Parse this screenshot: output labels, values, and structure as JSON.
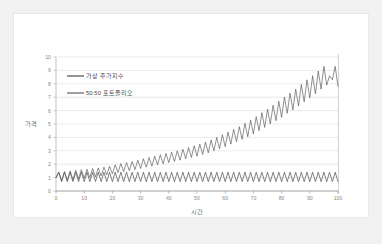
{
  "chart_data": {
    "type": "line",
    "title": "",
    "xlabel": "시간",
    "ylabel": "가격",
    "xlim": [
      0,
      100
    ],
    "ylim": [
      0,
      10
    ],
    "xticks": [
      0,
      10,
      20,
      30,
      40,
      50,
      60,
      70,
      80,
      90,
      100
    ],
    "xtick_labels": [
      "0",
      "10",
      "20",
      "30",
      "40",
      "50",
      "60",
      "70",
      "80",
      "90",
      "100"
    ],
    "yticks": [
      0,
      1,
      2,
      3,
      4,
      5,
      6,
      7,
      8,
      9,
      10
    ],
    "ytick_labels": [
      "0",
      "1",
      "2",
      "3",
      "4",
      "5",
      "6",
      "7",
      "8",
      "9",
      "10"
    ],
    "grid": true,
    "grid_axis": "y",
    "legend_position": "upper-left",
    "legend": [
      "가상 주가지수",
      "50:50 포트폴리오"
    ],
    "series": [
      {
        "name": "가상 주가지수",
        "color": "#3f3f3f",
        "x": [
          0,
          1,
          2,
          3,
          4,
          5,
          6,
          7,
          8,
          9,
          10,
          11,
          12,
          13,
          14,
          15,
          16,
          17,
          18,
          19,
          20,
          21,
          22,
          23,
          24,
          25,
          26,
          27,
          28,
          29,
          30,
          31,
          32,
          33,
          34,
          35,
          36,
          37,
          38,
          39,
          40,
          41,
          42,
          43,
          44,
          45,
          46,
          47,
          48,
          49,
          50,
          51,
          52,
          53,
          54,
          55,
          56,
          57,
          58,
          59,
          60,
          61,
          62,
          63,
          64,
          65,
          66,
          67,
          68,
          69,
          70,
          71,
          72,
          73,
          74,
          75,
          76,
          77,
          78,
          79,
          80,
          81,
          82,
          83,
          84,
          85,
          86,
          87,
          88,
          89,
          90,
          91,
          92,
          93,
          94,
          95,
          96,
          97,
          98,
          99,
          100
        ],
        "values": [
          1.0,
          1.4,
          0.7,
          1.4,
          0.7,
          1.4,
          0.7,
          1.4,
          0.7,
          1.4,
          0.7,
          1.4,
          0.7,
          1.4,
          0.7,
          1.4,
          0.7,
          1.4,
          0.7,
          1.4,
          0.7,
          1.4,
          0.7,
          1.4,
          0.7,
          1.4,
          0.7,
          1.4,
          0.7,
          1.4,
          0.7,
          1.4,
          0.7,
          1.4,
          0.7,
          1.4,
          0.7,
          1.4,
          0.7,
          1.4,
          0.7,
          1.4,
          0.7,
          1.4,
          0.7,
          1.4,
          0.7,
          1.4,
          0.7,
          1.4,
          0.7,
          1.4,
          0.7,
          1.4,
          0.7,
          1.4,
          0.7,
          1.4,
          0.7,
          1.4,
          0.7,
          1.4,
          0.7,
          1.4,
          0.7,
          1.4,
          0.7,
          1.4,
          0.7,
          1.4,
          0.7,
          1.4,
          0.7,
          1.4,
          0.7,
          1.4,
          0.7,
          1.4,
          0.7,
          1.4,
          0.7,
          1.4,
          0.7,
          1.4,
          0.7,
          1.4,
          0.7,
          1.4,
          0.7,
          1.4,
          0.7,
          1.4,
          0.7,
          1.4,
          0.7,
          1.4,
          0.7,
          1.4,
          0.7,
          1.4,
          0.7
        ]
      },
      {
        "name": "50:50 포트폴리오",
        "color": "#555555",
        "x": [
          0,
          1,
          2,
          3,
          4,
          5,
          6,
          7,
          8,
          9,
          10,
          11,
          12,
          13,
          14,
          15,
          16,
          17,
          18,
          19,
          20,
          21,
          22,
          23,
          24,
          25,
          26,
          27,
          28,
          29,
          30,
          31,
          32,
          33,
          34,
          35,
          36,
          37,
          38,
          39,
          40,
          41,
          42,
          43,
          44,
          45,
          46,
          47,
          48,
          49,
          50,
          51,
          52,
          53,
          54,
          55,
          56,
          57,
          58,
          59,
          60,
          61,
          62,
          63,
          64,
          65,
          66,
          67,
          68,
          69,
          70,
          71,
          72,
          73,
          74,
          75,
          76,
          77,
          78,
          79,
          80,
          81,
          82,
          83,
          84,
          85,
          86,
          87,
          88,
          89,
          90,
          91,
          92,
          93,
          94,
          95,
          96,
          97,
          98,
          99,
          100
        ],
        "values": [
          1.0,
          1.4,
          0.75,
          1.45,
          0.8,
          1.5,
          0.85,
          1.55,
          0.9,
          1.6,
          0.95,
          1.62,
          1.0,
          1.68,
          1.05,
          1.72,
          1.12,
          1.78,
          1.2,
          1.85,
          1.28,
          1.95,
          1.38,
          2.05,
          1.45,
          2.12,
          1.52,
          2.2,
          1.6,
          2.3,
          1.68,
          2.4,
          1.78,
          2.5,
          1.85,
          2.6,
          1.95,
          2.7,
          2.02,
          2.8,
          2.12,
          2.9,
          2.2,
          3.0,
          2.3,
          3.12,
          2.4,
          3.25,
          2.5,
          3.38,
          2.6,
          3.5,
          2.72,
          3.65,
          2.85,
          3.8,
          3.0,
          4.0,
          3.15,
          4.2,
          3.3,
          4.4,
          3.5,
          4.6,
          3.68,
          4.8,
          3.85,
          5.05,
          4.05,
          5.3,
          4.25,
          5.55,
          4.5,
          5.85,
          4.75,
          6.1,
          5.0,
          6.4,
          5.25,
          6.7,
          5.5,
          7.0,
          5.8,
          7.3,
          6.05,
          7.6,
          6.35,
          7.95,
          6.65,
          8.3,
          6.95,
          8.6,
          7.25,
          8.95,
          7.6,
          9.3,
          7.9,
          8.6,
          8.3,
          9.3,
          7.8
        ]
      }
    ]
  },
  "legend": {
    "items": [
      {
        "label": "가상 주가지수",
        "color": "#3f3f3f"
      },
      {
        "label": "50:50 포트폴리오",
        "color": "#555555"
      }
    ]
  },
  "axes": {
    "y_title": "가격",
    "x_title": "시간"
  }
}
